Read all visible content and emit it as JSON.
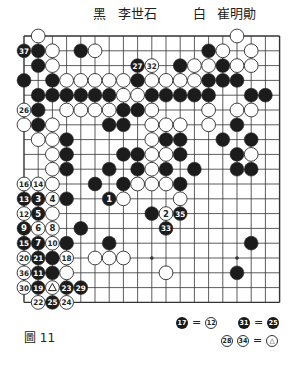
{
  "header": {
    "black_label": "黑",
    "black_player": "李世石",
    "white_label": "白",
    "white_player": "崔明勛"
  },
  "figure_caption": "圖 11",
  "notes": [
    {
      "left": {
        "color": "black",
        "num": "17"
      },
      "eq": "=",
      "right": [
        {
          "color": "white",
          "num": "12"
        }
      ]
    },
    {
      "left": {
        "color": "black",
        "num": "31"
      },
      "eq": "=",
      "right": [
        {
          "color": "black",
          "num": "25"
        }
      ]
    },
    {
      "left_multi": [
        {
          "color": "white",
          "num": "28"
        },
        {
          "color": "white",
          "num": "34"
        }
      ],
      "eq": "=",
      "right": [
        {
          "color": "white",
          "num": "△"
        }
      ]
    }
  ],
  "board": {
    "size": 19,
    "origin_x": 24,
    "origin_y": 36,
    "dx": 14.2,
    "dy": 14.8,
    "line_color": "#333333",
    "star_points": [
      [
        3,
        3
      ],
      [
        3,
        9
      ],
      [
        3,
        15
      ],
      [
        9,
        3
      ],
      [
        9,
        9
      ],
      [
        9,
        15
      ],
      [
        15,
        3
      ],
      [
        15,
        9
      ],
      [
        15,
        15
      ]
    ],
    "stones": [
      {
        "c": 1,
        "r": 0,
        "color": "w"
      },
      {
        "c": 15,
        "r": 0,
        "color": "w"
      },
      {
        "c": 0,
        "r": 1,
        "color": "b",
        "label": "37"
      },
      {
        "c": 1,
        "r": 1,
        "color": "b"
      },
      {
        "c": 2,
        "r": 1,
        "color": "w"
      },
      {
        "c": 4,
        "r": 1,
        "color": "b"
      },
      {
        "c": 5,
        "r": 1,
        "color": "w"
      },
      {
        "c": 13,
        "r": 1,
        "color": "b"
      },
      {
        "c": 14,
        "r": 1,
        "color": "w"
      },
      {
        "c": 16,
        "r": 1,
        "color": "w"
      },
      {
        "c": 1,
        "r": 2,
        "color": "b"
      },
      {
        "c": 2,
        "r": 2,
        "color": "w"
      },
      {
        "c": 8,
        "r": 2,
        "color": "b",
        "label": "27"
      },
      {
        "c": 9,
        "r": 2,
        "color": "w",
        "label": "32"
      },
      {
        "c": 11,
        "r": 2,
        "color": "b"
      },
      {
        "c": 12,
        "r": 2,
        "color": "w"
      },
      {
        "c": 13,
        "r": 2,
        "color": "w"
      },
      {
        "c": 14,
        "r": 2,
        "color": "b"
      },
      {
        "c": 15,
        "r": 2,
        "color": "w"
      },
      {
        "c": 16,
        "r": 2,
        "color": "w"
      },
      {
        "c": 0,
        "r": 3,
        "color": "b"
      },
      {
        "c": 2,
        "r": 3,
        "color": "b"
      },
      {
        "c": 3,
        "r": 3,
        "color": "w"
      },
      {
        "c": 4,
        "r": 3,
        "color": "w"
      },
      {
        "c": 5,
        "r": 3,
        "color": "w"
      },
      {
        "c": 6,
        "r": 3,
        "color": "w"
      },
      {
        "c": 7,
        "r": 3,
        "color": "w"
      },
      {
        "c": 8,
        "r": 3,
        "color": "b"
      },
      {
        "c": 9,
        "r": 3,
        "color": "w"
      },
      {
        "c": 10,
        "r": 3,
        "color": "w"
      },
      {
        "c": 11,
        "r": 3,
        "color": "w"
      },
      {
        "c": 12,
        "r": 3,
        "color": "w"
      },
      {
        "c": 13,
        "r": 3,
        "color": "b"
      },
      {
        "c": 14,
        "r": 3,
        "color": "b"
      },
      {
        "c": 15,
        "r": 3,
        "color": "b"
      },
      {
        "c": 1,
        "r": 4,
        "color": "b"
      },
      {
        "c": 2,
        "r": 4,
        "color": "b"
      },
      {
        "c": 3,
        "r": 4,
        "color": "b"
      },
      {
        "c": 4,
        "r": 4,
        "color": "b"
      },
      {
        "c": 5,
        "r": 4,
        "color": "b"
      },
      {
        "c": 6,
        "r": 4,
        "color": "b"
      },
      {
        "c": 7,
        "r": 4,
        "color": "w"
      },
      {
        "c": 8,
        "r": 4,
        "color": "w"
      },
      {
        "c": 9,
        "r": 4,
        "color": "b"
      },
      {
        "c": 10,
        "r": 4,
        "color": "b"
      },
      {
        "c": 11,
        "r": 4,
        "color": "b"
      },
      {
        "c": 12,
        "r": 4,
        "color": "b"
      },
      {
        "c": 13,
        "r": 4,
        "color": "b"
      },
      {
        "c": 16,
        "r": 4,
        "color": "b"
      },
      {
        "c": 17,
        "r": 4,
        "color": "b"
      },
      {
        "c": 0,
        "r": 5,
        "color": "w",
        "label": "26"
      },
      {
        "c": 1,
        "r": 5,
        "color": "b"
      },
      {
        "c": 3,
        "r": 5,
        "color": "w"
      },
      {
        "c": 4,
        "r": 5,
        "color": "w"
      },
      {
        "c": 5,
        "r": 5,
        "color": "w"
      },
      {
        "c": 6,
        "r": 5,
        "color": "w"
      },
      {
        "c": 7,
        "r": 5,
        "color": "b"
      },
      {
        "c": 8,
        "r": 5,
        "color": "b"
      },
      {
        "c": 9,
        "r": 5,
        "color": "w"
      },
      {
        "c": 13,
        "r": 5,
        "color": "w"
      },
      {
        "c": 15,
        "r": 5,
        "color": "w"
      },
      {
        "c": 16,
        "r": 5,
        "color": "w"
      },
      {
        "c": 0,
        "r": 6,
        "color": "w"
      },
      {
        "c": 1,
        "r": 6,
        "color": "b"
      },
      {
        "c": 2,
        "r": 6,
        "color": "w"
      },
      {
        "c": 6,
        "r": 6,
        "color": "b"
      },
      {
        "c": 7,
        "r": 6,
        "color": "b"
      },
      {
        "c": 9,
        "r": 6,
        "color": "w"
      },
      {
        "c": 10,
        "r": 6,
        "color": "w"
      },
      {
        "c": 11,
        "r": 6,
        "color": "w"
      },
      {
        "c": 13,
        "r": 6,
        "color": "w"
      },
      {
        "c": 15,
        "r": 6,
        "color": "b"
      },
      {
        "c": 1,
        "r": 7,
        "color": "w"
      },
      {
        "c": 2,
        "r": 7,
        "color": "w"
      },
      {
        "c": 3,
        "r": 7,
        "color": "b"
      },
      {
        "c": 9,
        "r": 7,
        "color": "w"
      },
      {
        "c": 10,
        "r": 7,
        "color": "b"
      },
      {
        "c": 11,
        "r": 7,
        "color": "b"
      },
      {
        "c": 14,
        "r": 7,
        "color": "b"
      },
      {
        "c": 16,
        "r": 7,
        "color": "b"
      },
      {
        "c": 2,
        "r": 8,
        "color": "w"
      },
      {
        "c": 3,
        "r": 8,
        "color": "b"
      },
      {
        "c": 7,
        "r": 8,
        "color": "b"
      },
      {
        "c": 8,
        "r": 8,
        "color": "b"
      },
      {
        "c": 9,
        "r": 8,
        "color": "w"
      },
      {
        "c": 10,
        "r": 8,
        "color": "w"
      },
      {
        "c": 11,
        "r": 8,
        "color": "b"
      },
      {
        "c": 15,
        "r": 8,
        "color": "b"
      },
      {
        "c": 16,
        "r": 8,
        "color": "w"
      },
      {
        "c": 2,
        "r": 9,
        "color": "w"
      },
      {
        "c": 3,
        "r": 9,
        "color": "b"
      },
      {
        "c": 6,
        "r": 9,
        "color": "b"
      },
      {
        "c": 8,
        "r": 9,
        "color": "b"
      },
      {
        "c": 9,
        "r": 9,
        "color": "w"
      },
      {
        "c": 10,
        "r": 9,
        "color": "b"
      },
      {
        "c": 12,
        "r": 9,
        "color": "b"
      },
      {
        "c": 15,
        "r": 9,
        "color": "b"
      },
      {
        "c": 16,
        "r": 9,
        "color": "b"
      },
      {
        "c": 0,
        "r": 10,
        "color": "w",
        "label": "16"
      },
      {
        "c": 1,
        "r": 10,
        "color": "w",
        "label": "14"
      },
      {
        "c": 2,
        "r": 10,
        "color": "w"
      },
      {
        "c": 5,
        "r": 10,
        "color": "b"
      },
      {
        "c": 7,
        "r": 10,
        "color": "b"
      },
      {
        "c": 8,
        "r": 10,
        "color": "w"
      },
      {
        "c": 9,
        "r": 10,
        "color": "w"
      },
      {
        "c": 10,
        "r": 10,
        "color": "w"
      },
      {
        "c": 11,
        "r": 10,
        "color": "b"
      },
      {
        "c": 0,
        "r": 11,
        "color": "b",
        "label": "13"
      },
      {
        "c": 1,
        "r": 11,
        "color": "b",
        "label": "3"
      },
      {
        "c": 2,
        "r": 11,
        "color": "w",
        "label": "4"
      },
      {
        "c": 3,
        "r": 11,
        "color": "b"
      },
      {
        "c": 6,
        "r": 11,
        "color": "b",
        "label": "1"
      },
      {
        "c": 7,
        "r": 11,
        "color": "w"
      },
      {
        "c": 11,
        "r": 11,
        "color": "w"
      },
      {
        "c": 0,
        "r": 12,
        "color": "w",
        "label": "12"
      },
      {
        "c": 1,
        "r": 12,
        "color": "b",
        "label": "5"
      },
      {
        "c": 2,
        "r": 12,
        "color": "w"
      },
      {
        "c": 9,
        "r": 12,
        "color": "b"
      },
      {
        "c": 10,
        "r": 12,
        "color": "w",
        "label": "2"
      },
      {
        "c": 11,
        "r": 12,
        "color": "b",
        "label": "35"
      },
      {
        "c": 0,
        "r": 13,
        "color": "b",
        "label": "9"
      },
      {
        "c": 1,
        "r": 13,
        "color": "w",
        "label": "6"
      },
      {
        "c": 2,
        "r": 13,
        "color": "w",
        "label": "8"
      },
      {
        "c": 4,
        "r": 13,
        "color": "b"
      },
      {
        "c": 10,
        "r": 13,
        "color": "b",
        "label": "33"
      },
      {
        "c": 0,
        "r": 14,
        "color": "b",
        "label": "15"
      },
      {
        "c": 1,
        "r": 14,
        "color": "b",
        "label": "7"
      },
      {
        "c": 2,
        "r": 14,
        "color": "w",
        "label": "10"
      },
      {
        "c": 3,
        "r": 14,
        "color": "b"
      },
      {
        "c": 6,
        "r": 14,
        "color": "b"
      },
      {
        "c": 16,
        "r": 14,
        "color": "b"
      },
      {
        "c": 0,
        "r": 15,
        "color": "w",
        "label": "20"
      },
      {
        "c": 1,
        "r": 15,
        "color": "b",
        "label": "21"
      },
      {
        "c": 2,
        "r": 15,
        "color": "b"
      },
      {
        "c": 3,
        "r": 15,
        "color": "w",
        "label": "18"
      },
      {
        "c": 5,
        "r": 15,
        "color": "w"
      },
      {
        "c": 6,
        "r": 15,
        "color": "w"
      },
      {
        "c": 7,
        "r": 15,
        "color": "w"
      },
      {
        "c": 0,
        "r": 16,
        "color": "w",
        "label": "36"
      },
      {
        "c": 1,
        "r": 16,
        "color": "b",
        "label": "11"
      },
      {
        "c": 2,
        "r": 16,
        "color": "b"
      },
      {
        "c": 3,
        "r": 16,
        "color": "w"
      },
      {
        "c": 10,
        "r": 16,
        "color": "w"
      },
      {
        "c": 15,
        "r": 16,
        "color": "b"
      },
      {
        "c": 0,
        "r": 17,
        "color": "w",
        "label": "30"
      },
      {
        "c": 1,
        "r": 17,
        "color": "b",
        "label": "19"
      },
      {
        "c": 2,
        "r": 17,
        "color": "w",
        "label": "△"
      },
      {
        "c": 3,
        "r": 17,
        "color": "b",
        "label": "23"
      },
      {
        "c": 4,
        "r": 17,
        "color": "b",
        "label": "29"
      },
      {
        "c": 1,
        "r": 18,
        "color": "w",
        "label": "22"
      },
      {
        "c": 2,
        "r": 18,
        "color": "b",
        "label": "25"
      },
      {
        "c": 3,
        "r": 18,
        "color": "w",
        "label": "24"
      }
    ]
  }
}
